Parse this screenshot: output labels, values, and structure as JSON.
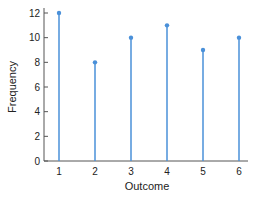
{
  "chart_data": {
    "type": "stem",
    "title": "",
    "xlabel": "Outcome",
    "ylabel": "Frequency",
    "categories": [
      "1",
      "2",
      "3",
      "4",
      "5",
      "6"
    ],
    "x": [
      1,
      2,
      3,
      4,
      5,
      6
    ],
    "values": [
      12,
      8,
      10,
      11,
      9,
      10
    ],
    "ylim": [
      0,
      12
    ],
    "yticks": [
      "0",
      "2",
      "4",
      "6",
      "8",
      "10",
      "12"
    ],
    "grid": false,
    "legend": null,
    "color": "#4a90d9"
  }
}
